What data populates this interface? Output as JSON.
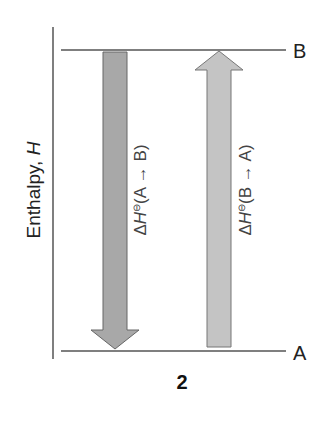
{
  "diagram": {
    "y_axis_label": "Enthalpy, ",
    "y_axis_symbol": "H",
    "levels": {
      "top": "B",
      "bottom": "A"
    },
    "arrows": [
      {
        "direction": "down",
        "label_prefix": "Δ",
        "label_symbol": "H",
        "label_super": "⊖",
        "label_text": "(A → B)",
        "color": "#a8a8a8"
      },
      {
        "direction": "up",
        "label_prefix": "Δ",
        "label_symbol": "H",
        "label_super": "⊖",
        "label_text": "(B → A)",
        "color": "#c4c4c4"
      }
    ],
    "panel_number": "2"
  }
}
